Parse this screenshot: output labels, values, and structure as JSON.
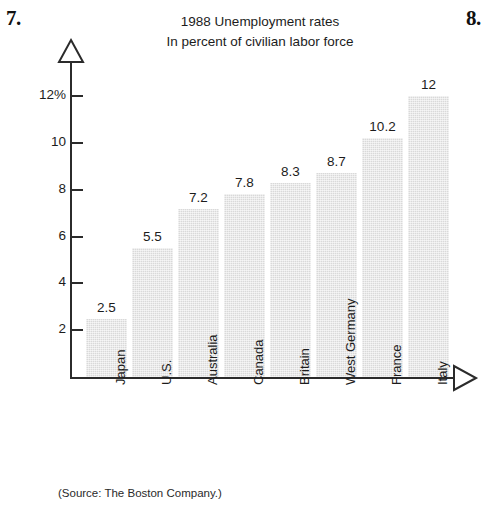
{
  "problem_numbers": {
    "left": "7.",
    "right": "8."
  },
  "chart_data": {
    "type": "bar",
    "title": "1988 Unemployment rates",
    "subtitle": "In percent of civilian labor force",
    "xlabel": "",
    "ylabel": "",
    "ylim": [
      0,
      12.8
    ],
    "grid": false,
    "legend": null,
    "y_ticks": [
      {
        "value": 2,
        "label": "2"
      },
      {
        "value": 4,
        "label": "4"
      },
      {
        "value": 6,
        "label": "6"
      },
      {
        "value": 8,
        "label": "8"
      },
      {
        "value": 10,
        "label": "10"
      },
      {
        "value": 12,
        "label": "12%"
      }
    ],
    "categories": [
      "Japan",
      "U.S.",
      "Australia",
      "Canada",
      "Britain",
      "West Germany",
      "France",
      "Italy"
    ],
    "values": [
      2.5,
      5.5,
      7.2,
      7.8,
      8.3,
      8.7,
      10.2,
      12
    ],
    "value_labels": [
      "2.5",
      "5.5",
      "7.2",
      "7.8",
      "8.3",
      "8.7",
      "10.2",
      "12"
    ],
    "bar_color": "#d9d9d9",
    "axis_color": "#2b2b2b",
    "source": "(Source: The Boston Company.)"
  }
}
